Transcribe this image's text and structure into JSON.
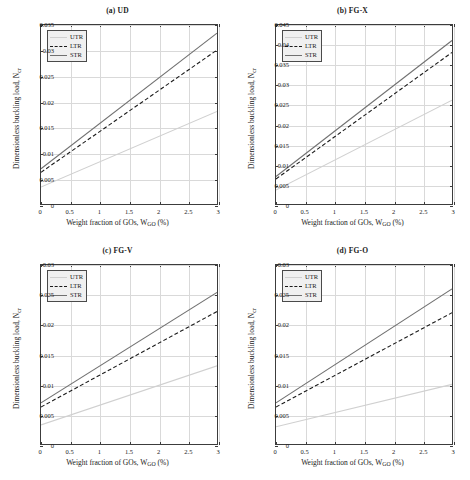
{
  "figure": {
    "axis_titles": {
      "x_prefix": "Weight fraction of GOs, W",
      "x_sub": "GO",
      "x_suffix": " (%)",
      "y_prefix": "Dimensionless buckling load, N",
      "y_sub": "cr"
    },
    "legend": {
      "entries": [
        {
          "label": "UTR",
          "style": "solid",
          "color": "#d0d0d0"
        },
        {
          "label": "LTR",
          "style": "dashed",
          "color": "#1a1a1a"
        },
        {
          "label": "STR",
          "style": "solid",
          "color": "#707070"
        }
      ]
    }
  },
  "chart_data": [
    {
      "type": "line",
      "title": "(a) UD",
      "xlabel": "Weight fraction of GOs, W_GO (%)",
      "ylabel": "Dimensionless buckling load, N_cr",
      "xlim": [
        0,
        3
      ],
      "ylim": [
        0,
        0.035
      ],
      "xticks": [
        0,
        0.5,
        1,
        1.5,
        2,
        2.5,
        3
      ],
      "xticklabels": [
        "0",
        "0.5",
        "1",
        "1.5",
        "2",
        "2.5",
        "3"
      ],
      "yticks": [
        0,
        0.005,
        0.01,
        0.015,
        0.02,
        0.025,
        0.03,
        0.035
      ],
      "yticklabels": [
        "0",
        "0.005",
        "0.01",
        "0.015",
        "0.02",
        "0.025",
        "0.03",
        "0.035"
      ],
      "grid": true,
      "legend_position": "upper left",
      "x": [
        0,
        3
      ],
      "series": [
        {
          "name": "UTR",
          "values": [
            0.0033,
            0.0181
          ]
        },
        {
          "name": "LTR",
          "values": [
            0.0062,
            0.0301
          ]
        },
        {
          "name": "STR",
          "values": [
            0.0069,
            0.0334
          ]
        }
      ]
    },
    {
      "type": "line",
      "title": "(b) FG-X",
      "xlabel": "Weight fraction of GOs, W_GO (%)",
      "ylabel": "Dimensionless buckling load, N_cr",
      "xlim": [
        0,
        3
      ],
      "ylim": [
        0,
        0.045
      ],
      "xticks": [
        0,
        0.5,
        1,
        1.5,
        2,
        2.5,
        3
      ],
      "xticklabels": [
        "0",
        "0.5",
        "1",
        "1.5",
        "2",
        "2.5",
        "3"
      ],
      "yticks": [
        0,
        0.005,
        0.01,
        0.015,
        0.02,
        0.025,
        0.03,
        0.035,
        0.04,
        0.045
      ],
      "yticklabels": [
        "0",
        "0.005",
        "0.01",
        "0.015",
        "0.02",
        "0.025",
        "0.03",
        "0.035",
        "0.04",
        "0.045"
      ],
      "grid": true,
      "legend_position": "upper left",
      "x": [
        0,
        3
      ],
      "series": [
        {
          "name": "UTR",
          "values": [
            0.0035,
            0.0261
          ]
        },
        {
          "name": "LTR",
          "values": [
            0.0063,
            0.0381
          ]
        },
        {
          "name": "STR",
          "values": [
            0.0069,
            0.0411
          ]
        }
      ]
    },
    {
      "type": "line",
      "title": "(c) FG-V",
      "xlabel": "Weight fraction of GOs, W_GO (%)",
      "ylabel": "Dimensionless buckling load, N_cr",
      "xlim": [
        0,
        3
      ],
      "ylim": [
        0,
        0.03
      ],
      "xticks": [
        0,
        0.5,
        1,
        1.5,
        2,
        2.5,
        3
      ],
      "xticklabels": [
        "0",
        "0.5",
        "1",
        "1.5",
        "2",
        "2.5",
        "3"
      ],
      "yticks": [
        0,
        0.005,
        0.01,
        0.015,
        0.02,
        0.025,
        0.03
      ],
      "yticklabels": [
        "0",
        "0.005",
        "0.01",
        "0.015",
        "0.02",
        "0.025",
        "0.03"
      ],
      "grid": true,
      "legend_position": "upper left",
      "x": [
        0,
        3
      ],
      "series": [
        {
          "name": "UTR",
          "values": [
            0.0032,
            0.0131
          ]
        },
        {
          "name": "LTR",
          "values": [
            0.0062,
            0.0222
          ]
        },
        {
          "name": "STR",
          "values": [
            0.0069,
            0.0254
          ]
        }
      ]
    },
    {
      "type": "line",
      "title": "(d) FG-O",
      "xlabel": "Weight fraction of GOs, W_GO (%)",
      "ylabel": "Dimensionless buckling load, N_cr",
      "xlim": [
        0,
        3
      ],
      "ylim": [
        0,
        0.03
      ],
      "xticks": [
        0,
        0.5,
        1,
        1.5,
        2,
        2.5,
        3
      ],
      "xticklabels": [
        "0",
        "0.5",
        "1",
        "1.5",
        "2",
        "2.5",
        "3"
      ],
      "yticks": [
        0,
        0.005,
        0.01,
        0.015,
        0.02,
        0.025,
        0.03
      ],
      "yticklabels": [
        "0",
        "0.005",
        "0.01",
        "0.015",
        "0.02",
        "0.025",
        "0.03"
      ],
      "grid": true,
      "legend_position": "upper left",
      "x": [
        0,
        3
      ],
      "series": [
        {
          "name": "UTR",
          "values": [
            0.0029,
            0.01
          ]
        },
        {
          "name": "LTR",
          "values": [
            0.0062,
            0.022
          ]
        },
        {
          "name": "STR",
          "values": [
            0.0069,
            0.026
          ]
        }
      ]
    }
  ]
}
